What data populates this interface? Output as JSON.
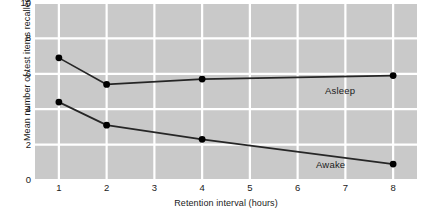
{
  "chart_data": {
    "type": "line",
    "title": "",
    "subtitle": "",
    "xlabel": "Retention interval (hours)",
    "ylabel": "Mean number of test items recalled",
    "x": [
      1,
      2,
      4,
      8
    ],
    "xlim": [
      0.5,
      8.5
    ],
    "ylim": [
      0,
      10
    ],
    "xticks": [
      1,
      2,
      3,
      4,
      5,
      6,
      7,
      8
    ],
    "xticklabels": [
      "1",
      "2",
      "3",
      "4",
      "5",
      "6",
      "7",
      "8"
    ],
    "yticks": [
      0,
      2,
      4,
      6,
      8,
      10
    ],
    "yticklabels": [
      "0",
      "2",
      "4",
      "6",
      "8",
      "10"
    ],
    "grid": "both-white-on-gray",
    "legend_position": "inline-annotations",
    "plot_background": "#c9c9c9",
    "grid_color": "#ffffff",
    "line_color": "#262626",
    "marker_color": "#000000",
    "series": [
      {
        "name": "Asleep",
        "values": [
          6.9,
          5.4,
          5.7,
          5.9
        ],
        "label_text": "Asleep"
      },
      {
        "name": "Awake",
        "values": [
          4.4,
          3.1,
          2.3,
          0.9
        ],
        "label_text": "Awake"
      }
    ]
  },
  "axes": {
    "ylabel": "Mean number of test items recalled",
    "xlabel": "Retention interval (hours)"
  }
}
